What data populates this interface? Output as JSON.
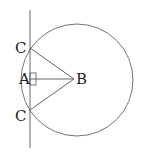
{
  "diagram": {
    "labels": {
      "c_top": "C",
      "a": "A",
      "b": "B",
      "c_bottom": "C"
    },
    "stroke_color": "#555555"
  }
}
